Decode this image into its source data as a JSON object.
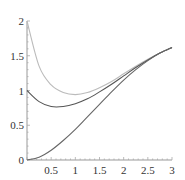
{
  "chart_data": {
    "type": "line",
    "title": "",
    "xlabel": "",
    "ylabel": "",
    "xlim": [
      0,
      3
    ],
    "ylim": [
      0,
      2
    ],
    "grid": false,
    "legend": null,
    "x_ticks": [
      "0.5",
      "1",
      "1.5",
      "2",
      "2.5",
      "3"
    ],
    "y_ticks": [
      "0",
      "0.5",
      "1",
      "1.5",
      "2"
    ],
    "x": [
      0,
      0.25,
      0.5,
      0.75,
      1.0,
      1.25,
      1.5,
      1.75,
      2.0,
      2.25,
      2.5,
      2.75,
      3.0
    ],
    "series": [
      {
        "name": "upper (light gray)",
        "color": "#bbbbbb",
        "values": [
          2.0,
          1.35,
          1.08,
          0.97,
          0.94,
          0.97,
          1.04,
          1.13,
          1.24,
          1.35,
          1.45,
          1.54,
          1.62
        ]
      },
      {
        "name": "middle (dark)",
        "color": "#555555",
        "values": [
          1.0,
          0.84,
          0.77,
          0.77,
          0.81,
          0.88,
          0.98,
          1.09,
          1.21,
          1.33,
          1.44,
          1.54,
          1.62
        ]
      },
      {
        "name": "lower (dark)",
        "color": "#666666",
        "values": [
          0.0,
          0.04,
          0.14,
          0.28,
          0.44,
          0.62,
          0.8,
          0.98,
          1.15,
          1.3,
          1.43,
          1.54,
          1.62
        ]
      }
    ]
  },
  "axes": {
    "origin_label": "0"
  }
}
